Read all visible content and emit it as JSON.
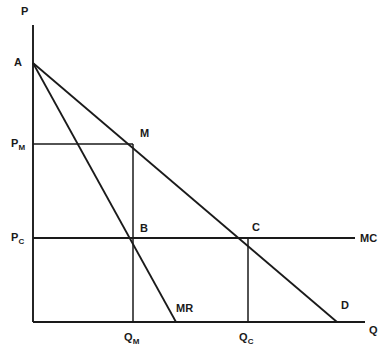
{
  "figure": {
    "kind": "economics-diagram",
    "background_color": "#ffffff",
    "line_color": "#1a1a1a",
    "width": 391,
    "height": 361
  },
  "axes": {
    "y_axis_label": "P",
    "x_axis_label": "Q",
    "origin": {
      "x": 33,
      "y": 322
    },
    "y_axis_top": 25,
    "x_axis_right": 365
  },
  "price_ticks": [
    {
      "key": "PM",
      "base": "P",
      "sub": "M",
      "y": 144
    },
    {
      "key": "PC",
      "base": "P",
      "sub": "C",
      "y": 238
    }
  ],
  "quantity_ticks": [
    {
      "key": "QM",
      "base": "Q",
      "sub": "M",
      "x": 133
    },
    {
      "key": "QC",
      "base": "Q",
      "sub": "C",
      "x": 248
    }
  ],
  "points": [
    {
      "key": "A",
      "label": "A",
      "x": 33,
      "y": 63,
      "label_x": 14,
      "label_y": 57
    },
    {
      "key": "M",
      "label": "M",
      "x": 133,
      "y": 144,
      "label_x": 140,
      "label_y": 128
    },
    {
      "key": "B",
      "label": "B",
      "x": 133,
      "y": 238,
      "label_x": 140,
      "label_y": 223
    },
    {
      "key": "C",
      "label": "C",
      "x": 248,
      "y": 238,
      "label_x": 252,
      "label_y": 222
    }
  ],
  "curves": [
    {
      "key": "demand",
      "label": "D",
      "from": {
        "x": 33,
        "y": 63
      },
      "to": {
        "x": 337,
        "y": 322
      },
      "label_x": 341,
      "label_y": 300
    },
    {
      "key": "marginal-revenue",
      "label": "MR",
      "from": {
        "x": 33,
        "y": 63
      },
      "to": {
        "x": 176,
        "y": 322
      },
      "label_x": 176,
      "label_y": 303
    },
    {
      "key": "marginal-cost",
      "label": "MC",
      "from": {
        "x": 33,
        "y": 238
      },
      "to": {
        "x": 355,
        "y": 238
      },
      "label_x": 360,
      "label_y": 233
    }
  ],
  "guides": [
    {
      "key": "pm-to-m",
      "from": {
        "x": 33,
        "y": 144
      },
      "to": {
        "x": 133,
        "y": 144
      }
    },
    {
      "key": "m-to-qm",
      "from": {
        "x": 133,
        "y": 144
      },
      "to": {
        "x": 133,
        "y": 322
      }
    },
    {
      "key": "c-to-qc",
      "from": {
        "x": 248,
        "y": 238
      },
      "to": {
        "x": 248,
        "y": 322
      }
    }
  ],
  "axis_label_positions": {
    "P": {
      "x": 21,
      "y": 6
    },
    "Q": {
      "x": 369,
      "y": 325
    }
  }
}
